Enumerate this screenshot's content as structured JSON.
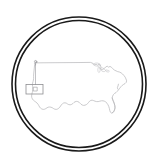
{
  "canvas": {
    "width": 158,
    "height": 160,
    "background": "#ffffff"
  },
  "emblem": {
    "title": "United States map in circular badge",
    "shape": "double-ring-circle",
    "center_x": 79,
    "center_y": 84,
    "outer_ring": {
      "radius": 67,
      "stroke_color": "#1a1a1a",
      "stroke_width": 1.6
    },
    "inner_ring": {
      "radius": 63.5,
      "stroke_color": "#1a1a1a",
      "stroke_width": 1.6
    },
    "ring_gap_color": "#ffffff"
  },
  "map": {
    "name": "contiguous-united-states",
    "outline_color": "#b5b5b8",
    "outline_width": 0.7,
    "lakes_color": "#c2c2c6",
    "lakes_width": 0.6,
    "fill": "none",
    "bbox": {
      "x": 30,
      "y": 61,
      "width": 98,
      "height": 58
    }
  },
  "annotations": {
    "marker": {
      "label": "location-marker",
      "x": 35.5,
      "y": 62.5,
      "color": "#9a9a9e"
    },
    "leader_line": {
      "label": "leader-line",
      "from_x": 35.5,
      "from_y": 64.0,
      "to_x": 35.5,
      "to_y": 85.0,
      "color": "#a8a8ac",
      "width": 0.7
    },
    "inset_box": {
      "label": "inset-callout-box",
      "x": 26.0,
      "y": 84.5,
      "width": 17.0,
      "height": 9.5,
      "stroke_color": "#8e8e92",
      "stroke_width": 0.8,
      "fill": "#ffffff",
      "inner_mark_color": "#9a9a9e"
    }
  },
  "accessibility": {
    "alt_text": "Line-art map of the contiguous United States inside a double circular border, with a pin in the Pacific Northwest linked to a small rectangular inset box."
  }
}
